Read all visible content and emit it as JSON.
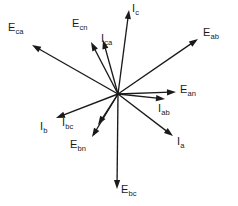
{
  "figure": {
    "type": "phasor-diagram",
    "width": 238,
    "height": 206,
    "background_color": "#ffffff",
    "line_color": "#1a1a1a",
    "origin": {
      "x": 118,
      "y": 94
    }
  },
  "chart_data": {
    "type": "scatter",
    "xlabel": "",
    "ylabel": "",
    "grid": false,
    "legend": "none",
    "coordinate_system": "screen-pixels-origin-at-118-94",
    "phasors": [
      {
        "id": "E_ca",
        "label_base": "E",
        "label_sub": "ca",
        "kind": "voltage",
        "tip": {
          "x": 32,
          "y": 45
        },
        "label_pos": {
          "x": 8,
          "y": 22
        },
        "length_px": 99,
        "angle_deg": 150.3
      },
      {
        "id": "E_cn",
        "label_base": "E",
        "label_sub": "cn",
        "kind": "voltage",
        "tip": {
          "x": 91,
          "y": 42
        },
        "label_pos": {
          "x": 72,
          "y": 18
        },
        "length_px": 58.6,
        "angle_deg": 117.4
      },
      {
        "id": "I_ca",
        "label_base": "I",
        "label_sub": "ca",
        "kind": "current",
        "tip": {
          "x": 103,
          "y": 40
        },
        "label_pos": {
          "x": 101,
          "y": 33
        },
        "length_px": 55.9,
        "angle_deg": 105.1
      },
      {
        "id": "I_c",
        "label_base": "I",
        "label_sub": "c",
        "kind": "current",
        "tip": {
          "x": 129,
          "y": 10
        },
        "label_pos": {
          "x": 132,
          "y": 3
        },
        "length_px": 85,
        "angle_deg": 82.6
      },
      {
        "id": "E_ab",
        "label_base": "E",
        "label_sub": "ab",
        "kind": "voltage",
        "tip": {
          "x": 198,
          "y": 39
        },
        "label_pos": {
          "x": 203,
          "y": 27
        },
        "length_px": 96.6,
        "angle_deg": 34.7
      },
      {
        "id": "E_an",
        "label_base": "E",
        "label_sub": "an",
        "kind": "voltage",
        "tip": {
          "x": 176,
          "y": 92
        },
        "label_pos": {
          "x": 180,
          "y": 84
        },
        "length_px": 58,
        "angle_deg": 2.0
      },
      {
        "id": "I_ab",
        "label_base": "I",
        "label_sub": "ab",
        "kind": "current",
        "tip": {
          "x": 165,
          "y": 99
        },
        "label_pos": {
          "x": 158,
          "y": 103
        },
        "length_px": 47.3,
        "angle_deg": -6.1
      },
      {
        "id": "I_a",
        "label_base": "I",
        "label_sub": "a",
        "kind": "current",
        "tip": {
          "x": 173,
          "y": 136
        },
        "label_pos": {
          "x": 177,
          "y": 136
        },
        "length_px": 69.9,
        "angle_deg": -36.9
      },
      {
        "id": "E_bc",
        "label_base": "E",
        "label_sub": "bc",
        "kind": "voltage",
        "tip": {
          "x": 117,
          "y": 189
        },
        "label_pos": {
          "x": 121,
          "y": 184
        },
        "length_px": 95,
        "angle_deg": -89.4
      },
      {
        "id": "E_bn",
        "label_base": "E",
        "label_sub": "bn",
        "kind": "voltage",
        "tip": {
          "x": 92,
          "y": 137
        },
        "label_pos": {
          "x": 70,
          "y": 139
        },
        "length_px": 50.9,
        "angle_deg": -120.6
      },
      {
        "id": "I_bc",
        "label_base": "I",
        "label_sub": "bc",
        "kind": "current",
        "tip": {
          "x": 98,
          "y": 125
        },
        "label_pos": {
          "x": 62,
          "y": 117
        },
        "length_px": 36.9,
        "angle_deg": -122.9
      },
      {
        "id": "I_b",
        "label_base": "I",
        "label_sub": "b",
        "kind": "current",
        "tip": {
          "x": 56,
          "y": 118
        },
        "label_pos": {
          "x": 40,
          "y": 121
        },
        "length_px": 66.8,
        "angle_deg": -159.0
      }
    ]
  }
}
